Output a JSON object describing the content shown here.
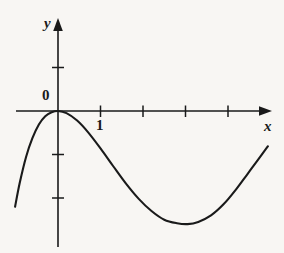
{
  "figure": {
    "kind": "math-function-graph",
    "background_color": "#f8f6f3",
    "stroke_color": "#1a1a1a"
  },
  "labels": {
    "y_axis": "y",
    "x_axis": "x",
    "origin": "0",
    "x_tick_one": "1"
  },
  "chart_data": {
    "type": "line",
    "title": "",
    "xlabel": "x",
    "ylabel": "y",
    "grid": false,
    "legend": null,
    "annotations": [
      {
        "text": "0",
        "x": 0,
        "y": 0,
        "role": "origin-label"
      },
      {
        "text": "1",
        "x": 1,
        "y": 0,
        "role": "x-tick-label"
      }
    ],
    "axes": {
      "origin_px": {
        "x": 58,
        "y": 111
      },
      "unit_px": {
        "x": 42.5,
        "y": 43.5
      },
      "x_axis_px": {
        "start": 16,
        "end": 272,
        "arrow": "right"
      },
      "y_axis_px": {
        "top": 18,
        "bottom": 247,
        "arrow": "up"
      },
      "xlim": [
        -1.0,
        5.0
      ],
      "ylim": [
        -3.2,
        2.2
      ],
      "x_ticks": [
        1,
        2,
        3,
        4
      ],
      "y_ticks": [
        1,
        -1,
        -2
      ]
    },
    "series": [
      {
        "name": "curve",
        "comment": "Smooth curve: tangent local maximum at the origin, falls to a local minimum near x = 3, then rises.",
        "x": [
          -1.01,
          -0.9,
          -0.75,
          -0.6,
          -0.45,
          -0.3,
          -0.15,
          0.0,
          0.2,
          0.45,
          0.7,
          1.0,
          1.3,
          1.6,
          1.9,
          2.2,
          2.5,
          2.8,
          3.05,
          3.3,
          3.6,
          3.9,
          4.2,
          4.45,
          4.7,
          4.94
        ],
        "y": [
          -2.2,
          -1.65,
          -1.05,
          -0.62,
          -0.31,
          -0.12,
          -0.03,
          0.0,
          -0.05,
          -0.22,
          -0.48,
          -0.86,
          -1.27,
          -1.67,
          -2.02,
          -2.3,
          -2.5,
          -2.58,
          -2.6,
          -2.55,
          -2.4,
          -2.14,
          -1.79,
          -1.46,
          -1.13,
          -0.81
        ]
      }
    ]
  }
}
